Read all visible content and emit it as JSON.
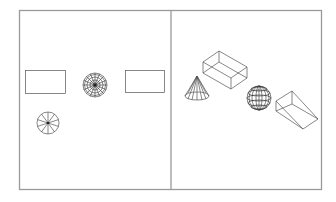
{
  "figure": {
    "colors": {
      "background": "#ffffff",
      "frame": "#9a9a9a",
      "wireframe": "#555555"
    },
    "panels": [
      {
        "name": "top-view",
        "objects": [
          {
            "type": "box-top-view",
            "x": 25,
            "y": 70,
            "w": 40,
            "h": 23
          },
          {
            "type": "sphere-top-view",
            "cx": 95,
            "cy": 85,
            "r": 12
          },
          {
            "type": "wedge-top-view",
            "x": 125,
            "y": 70,
            "w": 39,
            "h": 22
          },
          {
            "type": "cone-top-view",
            "cx": 48,
            "cy": 123,
            "r": 11,
            "spokes": 10
          }
        ]
      },
      {
        "name": "isometric-view",
        "objects": [
          {
            "type": "cone",
            "apex": [
              197,
              76
            ],
            "base_cx": 197,
            "base_cy": 96,
            "rx": 12,
            "ry": 4
          },
          {
            "type": "box"
          },
          {
            "type": "sphere",
            "cx": 259,
            "cy": 98,
            "r": 12
          },
          {
            "type": "wedge"
          }
        ]
      }
    ]
  }
}
